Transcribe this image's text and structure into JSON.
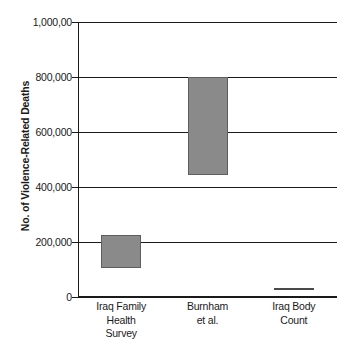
{
  "chart_data": {
    "type": "bar",
    "subtype": "floating-range-bar",
    "title": "",
    "xlabel": "",
    "ylabel": "No. of Violence-Related Deaths",
    "ylim": [
      0,
      1000000
    ],
    "grid": true,
    "legend": "none",
    "categories": [
      "Iraq Family Health Survey",
      "Burnham et al.",
      "Iraq Body Count"
    ],
    "category_lines": [
      [
        "Iraq Family",
        "Health",
        "Survey"
      ],
      [
        "Burnham",
        "et al."
      ],
      [
        "Iraq Body",
        "Count"
      ]
    ],
    "ytick_values": [
      0,
      200000,
      400000,
      600000,
      800000,
      1000000
    ],
    "ytick_labels": [
      "0",
      "200,000",
      "400,000",
      "600,000",
      "800,000",
      "1,000,00"
    ],
    "series": [
      {
        "name": "Violence-related deaths range",
        "ranges": [
          {
            "category": "Iraq Family Health Survey",
            "low": 104000,
            "high": 225000
          },
          {
            "category": "Burnham et al.",
            "low": 445000,
            "high": 800000
          },
          {
            "category": "Iraq Body Count",
            "low": 26000,
            "high": 34000
          }
        ]
      }
    ],
    "colors": {
      "bar_fill": "#8a8a8a",
      "bar_border": "#5e5e5e",
      "marker_fill": "#4a4a4a",
      "axis": "#1a1a1a",
      "grid": "#1a1a1a",
      "background": "#ffffff",
      "text": "#1a1a1a"
    }
  }
}
